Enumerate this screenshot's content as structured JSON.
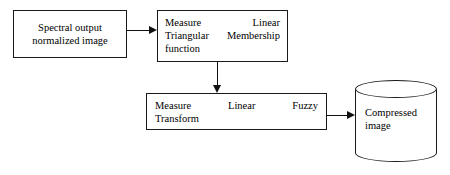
{
  "diagram": {
    "stroke_color": "#1a1a1a",
    "background_color": "#ffffff",
    "nodes": {
      "input": {
        "shape": "rectangle",
        "line1": "Spectral output",
        "line2": "normalized image"
      },
      "measure_triangular": {
        "shape": "rectangle",
        "row1_left": "Measure",
        "row1_right": "Linear",
        "row2_left": "Triangular",
        "row2_right": "Membership",
        "row3_left": "function"
      },
      "measure_transform": {
        "shape": "rectangle",
        "row1_left": "Measure",
        "row1_mid": "Linear",
        "row1_right": "Fuzzy",
        "row2_left": "Transform"
      },
      "output": {
        "shape": "cylinder",
        "line1": "Compressed",
        "line2": "image"
      }
    },
    "connectors": [
      {
        "name": "input-to-measure-triangular",
        "direction": "right"
      },
      {
        "name": "measure-triangular-to-measure-transform",
        "direction": "down"
      },
      {
        "name": "measure-transform-to-output",
        "direction": "right"
      }
    ]
  }
}
